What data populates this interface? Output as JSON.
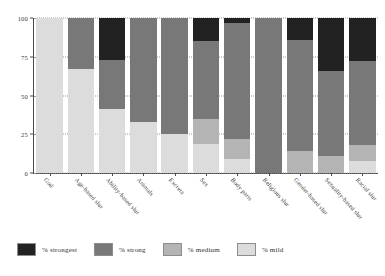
{
  "chart_data": {
    "type": "bar",
    "subtype": "stacked-bar-100-percent",
    "title": "",
    "xlabel": "",
    "ylabel": "",
    "ylim": [
      0,
      100
    ],
    "yticks": [
      0,
      25,
      50,
      75,
      100
    ],
    "ytick_labels": [
      "0",
      "25",
      "50",
      "75",
      "100"
    ],
    "grid": true,
    "legend_position": "bottom-left",
    "categories": [
      "God",
      "Age-based slur",
      "Ability-based slur",
      "Animals",
      "Excreta",
      "Sex",
      "Body parts",
      "Religious slur",
      "Gender-based slur",
      "Sexuality-based slur",
      "Racial slur"
    ],
    "series": [
      {
        "name": "% mild",
        "color": "#dcdcdc",
        "values": [
          100,
          67,
          41,
          33,
          25,
          19,
          9,
          0,
          0,
          0,
          8
        ]
      },
      {
        "name": "% medium",
        "color": "#b4b4b4",
        "values": [
          0,
          0,
          0,
          0,
          0,
          16,
          13,
          0,
          14,
          11,
          10
        ]
      },
      {
        "name": "% strong",
        "color": "#787878",
        "values": [
          0,
          33,
          32,
          67,
          75,
          50,
          75,
          100,
          72,
          55,
          54
        ]
      },
      {
        "name": "% strongest",
        "color": "#222222",
        "values": [
          0,
          0,
          27,
          0,
          0,
          15,
          3,
          0,
          14,
          34,
          28
        ]
      }
    ],
    "legend": [
      {
        "label": "% strongest",
        "color": "#222222"
      },
      {
        "label": "% strong",
        "color": "#787878"
      },
      {
        "label": "% medium",
        "color": "#b4b4b4"
      },
      {
        "label": "% mild",
        "color": "#dcdcdc"
      }
    ]
  }
}
